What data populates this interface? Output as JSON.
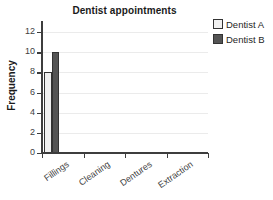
{
  "chart_data": {
    "type": "bar",
    "title": "Dentist appointments",
    "xlabel": "",
    "ylabel": "Frequency",
    "categories": [
      "Fillings",
      "Cleaning",
      "Dentures",
      "Extraction"
    ],
    "series": [
      {
        "name": "Dentist A",
        "values": [
          8,
          0,
          0,
          0
        ],
        "color": "#f0f0f0"
      },
      {
        "name": "Dentist B",
        "values": [
          10,
          0,
          0,
          0
        ],
        "color": "#545454"
      }
    ],
    "ylim": [
      0,
      13
    ],
    "yticks": [
      0,
      2,
      4,
      6,
      8,
      10,
      12
    ],
    "ytick_labels": [
      "0",
      "2",
      "4",
      "6",
      "8",
      "10",
      "12"
    ],
    "grid": "horizontal",
    "legend_position": "top-right-outside",
    "bar_border_color": "#333333",
    "axis_color": "#3d3d3d",
    "gridline_color": "#ebebeb",
    "background": "#ffffff"
  },
  "legend": {
    "entries": [
      {
        "label": "Dentist A",
        "color": "#f0f0f0"
      },
      {
        "label": "Dentist B",
        "color": "#545454"
      }
    ]
  },
  "axes": {
    "y_title": "Frequency",
    "y_labels": [
      "12",
      "10",
      "8",
      "6",
      "4",
      "2",
      "0"
    ],
    "x_labels": [
      "Fillings",
      "Cleaning",
      "Dentures",
      "Extraction"
    ]
  },
  "header": {
    "title": "Dentist appointments"
  }
}
